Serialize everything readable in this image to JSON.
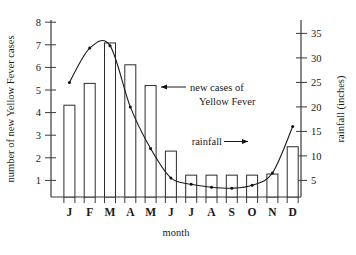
{
  "chart_data": {
    "type": "bar",
    "title": "",
    "xlabel": "month",
    "categories": [
      "J",
      "F",
      "M",
      "A",
      "M",
      "J",
      "J",
      "A",
      "S",
      "O",
      "N",
      "D"
    ],
    "month_names": [
      "January",
      "February",
      "March",
      "April",
      "May",
      "June",
      "July",
      "August",
      "September",
      "October",
      "November",
      "December"
    ],
    "series": [
      {
        "name": "new cases of Yellow Fever",
        "render": "bar",
        "axis": "left",
        "values": [
          4.2,
          5.2,
          7.05,
          6.05,
          5.1,
          2.1,
          1.0,
          1.0,
          1.0,
          1.0,
          1.05,
          2.3
        ]
      },
      {
        "name": "rainfall",
        "render": "line",
        "axis": "right",
        "unit": "inches",
        "values": [
          25,
          32,
          32.5,
          20,
          11.5,
          5.5,
          4.2,
          3.6,
          3.4,
          4.0,
          6.5,
          16
        ]
      }
    ],
    "left_axis": {
      "label": "number of new Yellow Fever cases",
      "ticks": [
        1,
        2,
        3,
        4,
        5,
        6,
        7,
        8
      ],
      "ylim": [
        0,
        8
      ]
    },
    "right_axis": {
      "label": "rainfall (inches)",
      "ticks": [
        5,
        10,
        15,
        20,
        25,
        30,
        35
      ],
      "ylim": [
        0,
        40
      ]
    },
    "grid": false,
    "legend_position": "none",
    "annotations": [
      {
        "id": "cases",
        "line1": "new cases of",
        "line2": "Yellow Fever",
        "arrow": "left"
      },
      {
        "id": "rainfall",
        "line1": "rainfall",
        "line2": "",
        "arrow": "right"
      }
    ]
  },
  "labels": {
    "left_axis_title": "number of new Yellow Fever cases",
    "right_axis_title": "rainfall (inches)",
    "x_axis_title": "month",
    "anno_cases_line1": "new cases of",
    "anno_cases_line2": "Yellow Fever",
    "anno_rainfall": "rainfall",
    "tick_l1": "1",
    "tick_l2": "2",
    "tick_l3": "3",
    "tick_l4": "4",
    "tick_l5": "5",
    "tick_l6": "6",
    "tick_l7": "7",
    "tick_l8": "8",
    "tick_r5": "5",
    "tick_r10": "10",
    "tick_r15": "15",
    "tick_r20": "20",
    "tick_r25": "25",
    "tick_r30": "30",
    "tick_r35": "35",
    "m0": "J",
    "m1": "F",
    "m2": "M",
    "m3": "A",
    "m4": "M",
    "m5": "J",
    "m6": "J",
    "m7": "A",
    "m8": "S",
    "m9": "O",
    "m10": "N",
    "m11": "D"
  },
  "colors": {
    "ink": "#1a1a1a",
    "axis": "#3a3a3a",
    "bar_fill": "#ffffff",
    "bar_stroke": "#2b2b2b",
    "background": "#ffffff"
  }
}
